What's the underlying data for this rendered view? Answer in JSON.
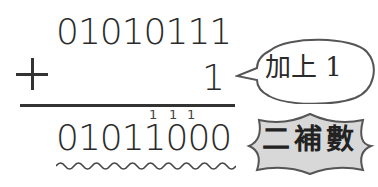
{
  "diagram": {
    "operand_top": "01010111",
    "operator": "+",
    "operand_bottom": "1",
    "carries": [
      "1",
      "1",
      "1"
    ],
    "result": "01011000",
    "callout_add": "加上 1",
    "callout_result": "二補數"
  },
  "colors": {
    "ink": "#2b2b2b",
    "badge_fill": "#d8d8d8",
    "badge_stroke": "#555555",
    "bubble_stroke": "#555555"
  }
}
